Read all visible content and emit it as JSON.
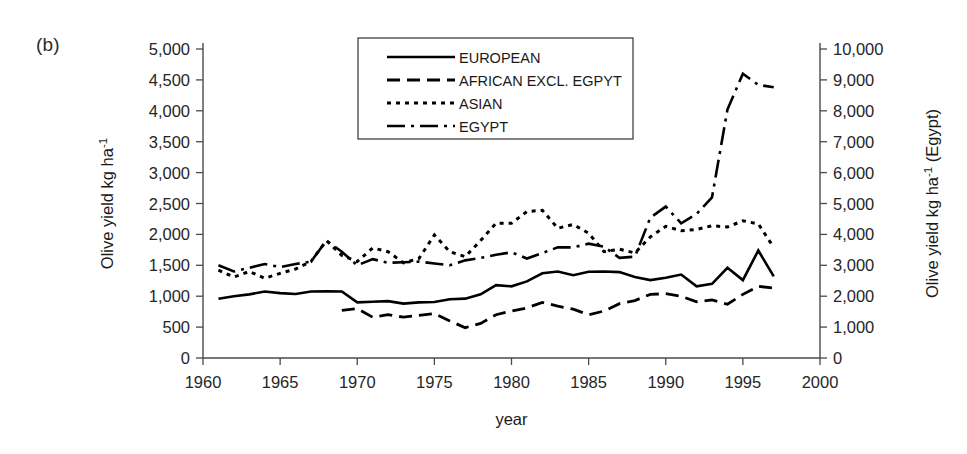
{
  "figure": {
    "panel_label": "(b)"
  },
  "chart_data": {
    "type": "line",
    "title": "",
    "subtitle": "",
    "xlabel": "year",
    "ylabel": "Olive yield  kg ha-1",
    "ylabel_parts": {
      "main": "Olive yield  kg ha",
      "sup": "-1"
    },
    "y2label": "Olive yield  kg ha-1 (Egypt)",
    "y2label_parts": {
      "main": "Olive yield  kg ha",
      "sup": "-1",
      "tail": " (Egypt)"
    },
    "xlim": [
      1960,
      2000
    ],
    "ylim": [
      0,
      5000
    ],
    "y2lim": [
      0,
      10000
    ],
    "grid": false,
    "legend_position": "top-center",
    "xticks": [
      1960,
      1965,
      1970,
      1975,
      1980,
      1985,
      1990,
      1995,
      2000
    ],
    "xticklabels": [
      "1960",
      "1965",
      "1970",
      "1975",
      "1980",
      "1985",
      "1990",
      "1995",
      "2000"
    ],
    "yticks": [
      0,
      500,
      1000,
      1500,
      2000,
      2500,
      3000,
      3500,
      4000,
      4500,
      5000
    ],
    "yticklabels": [
      "0",
      "500",
      "1,000",
      "1,500",
      "2,000",
      "2,500",
      "3,000",
      "3,500",
      "4,000",
      "4,500",
      "5,000"
    ],
    "y2ticks": [
      0,
      1000,
      2000,
      3000,
      4000,
      5000,
      6000,
      7000,
      8000,
      9000,
      10000
    ],
    "y2ticklabels": [
      "0",
      "1,000",
      "2,000",
      "3,000",
      "4,000",
      "5,000",
      "6,000",
      "7,000",
      "8,000",
      "9,000",
      "10,000"
    ],
    "series": [
      {
        "name": "EUROPEAN",
        "label": "EUROPEAN",
        "axis": "left",
        "linestyle": "solid",
        "dasharray": "",
        "linewidth": 2.6,
        "x": [
          1961,
          1962,
          1963,
          1964,
          1965,
          1966,
          1967,
          1968,
          1969,
          1970,
          1971,
          1972,
          1973,
          1974,
          1975,
          1976,
          1977,
          1978,
          1979,
          1980,
          1981,
          1982,
          1983,
          1984,
          1985,
          1986,
          1987,
          1988,
          1989,
          1990,
          1991,
          1992,
          1993,
          1994,
          1995,
          1996,
          1997
        ],
        "y": [
          960,
          1000,
          1030,
          1075,
          1050,
          1035,
          1075,
          1080,
          1075,
          900,
          910,
          920,
          880,
          900,
          905,
          950,
          960,
          1030,
          1180,
          1160,
          1240,
          1370,
          1400,
          1340,
          1395,
          1400,
          1390,
          1310,
          1260,
          1300,
          1350,
          1160,
          1200,
          1460,
          1260,
          1740,
          1320
        ]
      },
      {
        "name": "AFRICAN EXCL. EGPYT",
        "label": "AFRICAN EXCL. EGPYT",
        "axis": "left",
        "linestyle": "dashed",
        "dasharray": "13,7",
        "linewidth": 2.8,
        "x": [
          1969,
          1970,
          1971,
          1972,
          1973,
          1974,
          1975,
          1976,
          1977,
          1978,
          1979,
          1980,
          1981,
          1982,
          1983,
          1984,
          1985,
          1986,
          1987,
          1988,
          1989,
          1990,
          1991,
          1992,
          1993,
          1994,
          1995,
          1996,
          1997
        ],
        "y": [
          770,
          800,
          660,
          700,
          660,
          690,
          720,
          600,
          490,
          560,
          700,
          760,
          810,
          900,
          840,
          790,
          700,
          760,
          880,
          930,
          1030,
          1040,
          1000,
          910,
          940,
          870,
          1030,
          1160,
          1130
        ]
      },
      {
        "name": "ASIAN",
        "label": "ASIAN",
        "axis": "left",
        "linestyle": "dotted",
        "dasharray": "4,5",
        "linewidth": 3.0,
        "x": [
          1961,
          1962,
          1963,
          1964,
          1965,
          1966,
          1967,
          1968,
          1969,
          1970,
          1971,
          1972,
          1973,
          1974,
          1975,
          1976,
          1977,
          1978,
          1979,
          1980,
          1981,
          1982,
          1983,
          1984,
          1985,
          1986,
          1987,
          1988,
          1989,
          1990,
          1991,
          1992,
          1993,
          1994,
          1995,
          1996,
          1997
        ],
        "y": [
          1420,
          1310,
          1400,
          1290,
          1370,
          1440,
          1560,
          1900,
          1660,
          1560,
          1780,
          1720,
          1540,
          1610,
          1990,
          1720,
          1640,
          1900,
          2180,
          2180,
          2370,
          2390,
          2100,
          2160,
          2020,
          1720,
          1760,
          1700,
          1960,
          2130,
          2060,
          2080,
          2140,
          2120,
          2220,
          2170,
          1790
        ]
      },
      {
        "name": "EGYPT",
        "label": "EGYPT",
        "axis": "right",
        "linestyle": "dashdot",
        "dasharray": "18,6,3,6",
        "linewidth": 2.6,
        "x": [
          1961,
          1962,
          1963,
          1964,
          1965,
          1966,
          1967,
          1968,
          1969,
          1970,
          1971,
          1972,
          1973,
          1974,
          1975,
          1976,
          1977,
          1978,
          1979,
          1980,
          1981,
          1982,
          1983,
          1984,
          1985,
          1986,
          1987,
          1988,
          1989,
          1990,
          1991,
          1992,
          1993,
          1994,
          1995,
          1996,
          1997
        ],
        "y_left_scale": [
          1500,
          1400,
          1460,
          1520,
          1470,
          1520,
          1560,
          1900,
          1720,
          1500,
          1600,
          1540,
          1550,
          1560,
          1530,
          1500,
          1580,
          1620,
          1670,
          1710,
          1610,
          1700,
          1790,
          1790,
          1850,
          1800,
          1620,
          1640,
          2270,
          2450,
          2180,
          2330,
          2600,
          4020,
          4600,
          4420,
          4380
        ],
        "y": [
          3000,
          2800,
          2920,
          3040,
          2940,
          3040,
          3120,
          3800,
          3440,
          3000,
          3200,
          3080,
          3100,
          3120,
          3060,
          3000,
          3160,
          3240,
          3340,
          3420,
          3220,
          3400,
          3580,
          3580,
          3700,
          3600,
          3240,
          3280,
          4540,
          4900,
          4360,
          4660,
          5200,
          8040,
          9200,
          8840,
          8760
        ]
      }
    ]
  }
}
